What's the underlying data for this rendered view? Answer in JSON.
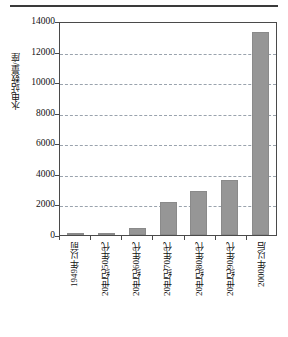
{
  "figure": {
    "top_rule": true,
    "bar_color": "#969696",
    "grid_color": "#9aa3ad",
    "axis_color": "#4a4a4a"
  },
  "chart_data": {
    "type": "bar",
    "title": "",
    "xlabel": "",
    "ylabel": "水电站数量/座",
    "categories": [
      "1949年以前",
      "20世纪50年代",
      "20世纪60年代",
      "20世纪70年代",
      "20世纪80年代",
      "20世纪90年代",
      "2000年以后"
    ],
    "values": [
      30,
      150,
      450,
      2150,
      2900,
      3600,
      13250
    ],
    "ylim": [
      0,
      14000
    ],
    "yticks": [
      0,
      2000,
      4000,
      6000,
      8000,
      10000,
      12000,
      14000
    ],
    "ytick_labels": [
      "0",
      "2000",
      "4000",
      "6000",
      "8000",
      "10000",
      "12000",
      "14000"
    ],
    "grid": "horizontal-dashed",
    "legend": "none",
    "series_name": "水电站数量"
  }
}
